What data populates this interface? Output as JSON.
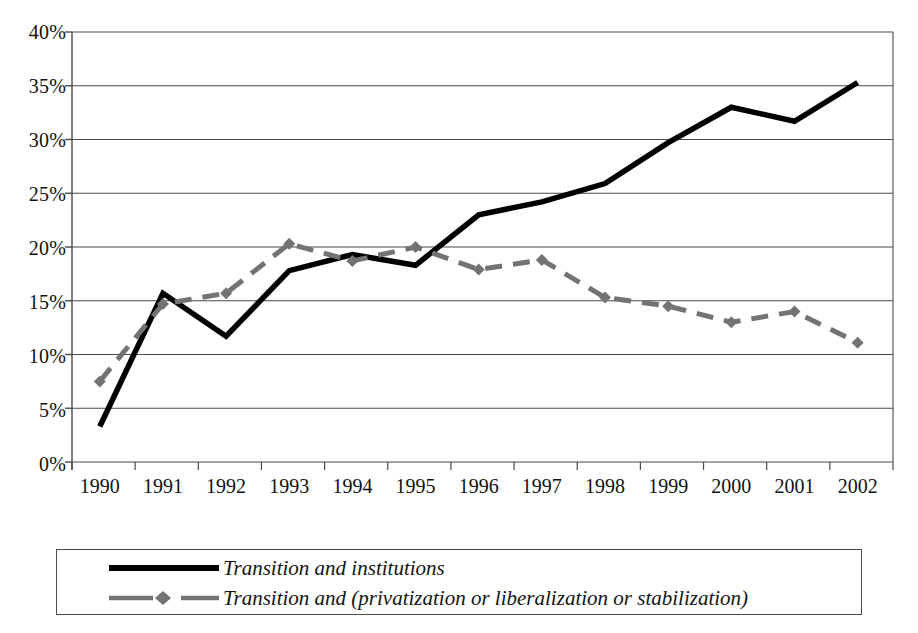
{
  "chart_data": {
    "type": "line",
    "title": "",
    "subtitle": "",
    "xlabel": "",
    "ylabel": "",
    "categories": [
      "1990",
      "1991",
      "1992",
      "1993",
      "1994",
      "1995",
      "1996",
      "1997",
      "1998",
      "1999",
      "2000",
      "2001",
      "2002"
    ],
    "ylim": [
      0,
      40
    ],
    "ytick_labels": [
      "0%",
      "5%",
      "10%",
      "15%",
      "20%",
      "25%",
      "30%",
      "35%",
      "40%"
    ],
    "ytick_values": [
      0,
      5,
      10,
      15,
      20,
      25,
      30,
      35,
      40
    ],
    "grid": "horizontal",
    "legend_position": "bottom",
    "series": [
      {
        "name": "Transition and institutions",
        "color": "#000000",
        "style": "solid",
        "marker": "none",
        "values": [
          3.3,
          15.7,
          11.7,
          17.8,
          19.3,
          18.3,
          23.0,
          24.2,
          25.9,
          29.7,
          33.0,
          31.7,
          35.3
        ]
      },
      {
        "name": "Transition and (privatization or liberalization or stabilization)",
        "color": "#737373",
        "style": "dashed",
        "marker": "diamond",
        "values": [
          7.5,
          14.7,
          15.7,
          20.3,
          18.7,
          20.0,
          17.9,
          18.8,
          15.3,
          14.5,
          13.0,
          14.0,
          11.1
        ]
      }
    ]
  },
  "legend": {
    "items": [
      {
        "label": "Transition and institutions",
        "key": "solid-black-line"
      },
      {
        "label": "Transition and (privatization or liberalization or stabilization)",
        "key": "dashed-gray-line-diamond"
      }
    ]
  },
  "colors": {
    "series_1": "#000000",
    "series_2": "#737373",
    "gridline": "#4a4a4a",
    "axis": "#4a4a4a",
    "background": "#ffffff"
  }
}
